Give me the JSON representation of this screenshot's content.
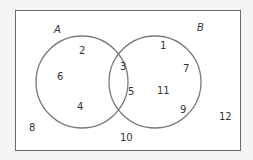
{
  "diagram": {
    "type": "venn",
    "sets": [
      {
        "label": "A",
        "only": [
          "2",
          "6",
          "4"
        ]
      },
      {
        "label": "B",
        "only": [
          "1",
          "7",
          "11",
          "9"
        ]
      }
    ],
    "intersection": [
      "3",
      "5"
    ],
    "outside": [
      "8",
      "10",
      "12"
    ],
    "colors": {
      "circle": "#7a7a7a",
      "border": "#6a6a6a",
      "background": "#ffffff"
    }
  },
  "labels": {
    "a": "A",
    "b": "B",
    "n2": "2",
    "n6": "6",
    "n4": "4",
    "n3": "3",
    "n5": "5",
    "n1": "1",
    "n7": "7",
    "n11": "11",
    "n9": "9",
    "n8": "8",
    "n10": "10",
    "n12": "12"
  }
}
